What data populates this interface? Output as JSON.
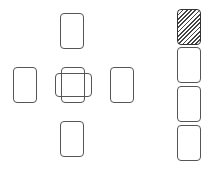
{
  "game": {
    "type": "cross-solitaire-layout",
    "colors": {
      "background": "#ffffff",
      "card_outline": "#555555",
      "card_back_pattern": "#444444"
    },
    "cross": {
      "slots": [
        {
          "id": "top",
          "x": 60,
          "y": 13,
          "orientation": "vertical",
          "face": "empty"
        },
        {
          "id": "left",
          "x": 13,
          "y": 67,
          "orientation": "vertical",
          "face": "empty"
        },
        {
          "id": "center-vertical",
          "x": 61,
          "y": 67,
          "orientation": "vertical",
          "face": "empty"
        },
        {
          "id": "center-horizontal",
          "x": 55,
          "y": 73,
          "orientation": "horizontal",
          "face": "empty"
        },
        {
          "id": "right",
          "x": 110,
          "y": 67,
          "orientation": "vertical",
          "face": "empty"
        },
        {
          "id": "bottom",
          "x": 60,
          "y": 121,
          "orientation": "vertical",
          "face": "empty"
        }
      ]
    },
    "column": {
      "slots": [
        {
          "id": "stock",
          "x": 177,
          "y": 9,
          "face": "back"
        },
        {
          "id": "pile-1",
          "x": 177,
          "y": 47,
          "face": "empty"
        },
        {
          "id": "pile-2",
          "x": 177,
          "y": 86,
          "face": "empty"
        },
        {
          "id": "pile-3",
          "x": 177,
          "y": 125,
          "face": "empty"
        }
      ]
    }
  }
}
